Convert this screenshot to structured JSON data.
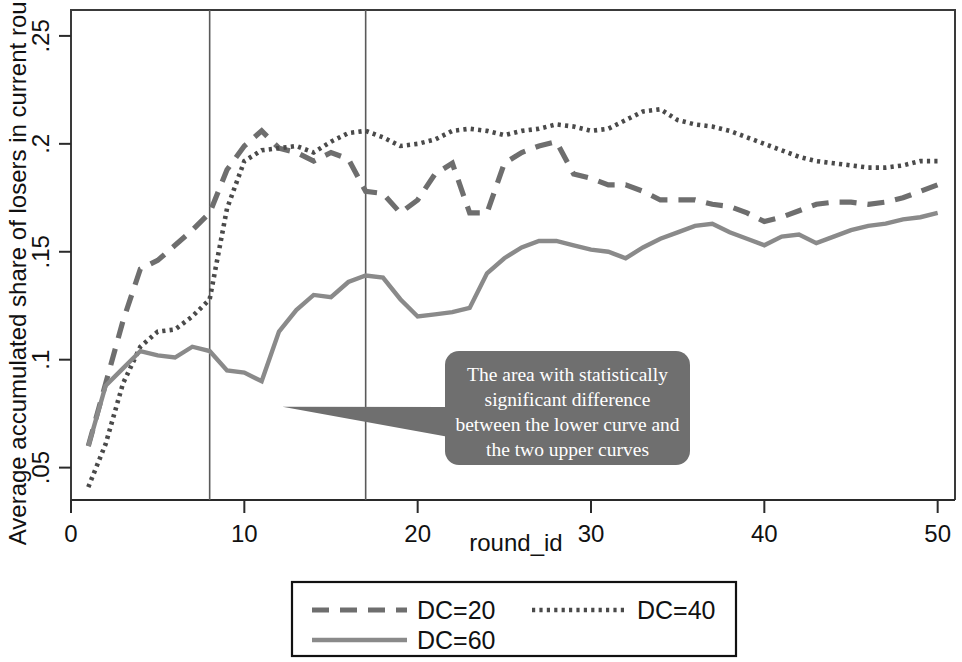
{
  "chart_data": {
    "type": "line",
    "title": "",
    "xlabel": "round_id",
    "ylabel": "Average accumulated share of losers in current round",
    "xlim": [
      0,
      51
    ],
    "ylim": [
      0.035,
      0.262
    ],
    "grid": false,
    "legend_position": "bottom",
    "x_ticks": [
      "0",
      "10",
      "20",
      "30",
      "40",
      "50"
    ],
    "x_tick_values": [
      0,
      10,
      20,
      30,
      40,
      50
    ],
    "y_ticks": [
      ".05",
      ".1",
      ".15",
      ".2",
      ".25"
    ],
    "y_tick_values": [
      0.05,
      0.1,
      0.15,
      0.2,
      0.25
    ],
    "x": [
      1,
      2,
      3,
      4,
      5,
      6,
      7,
      8,
      9,
      10,
      11,
      12,
      13,
      14,
      15,
      16,
      17,
      18,
      19,
      20,
      21,
      22,
      23,
      24,
      25,
      26,
      27,
      28,
      29,
      30,
      31,
      32,
      33,
      34,
      35,
      36,
      37,
      38,
      39,
      40,
      41,
      42,
      43,
      44,
      45,
      46,
      47,
      48,
      49,
      50
    ],
    "series": [
      {
        "name": "DC=20",
        "style": "dashed",
        "color": "#6e6e6e",
        "values": [
          0.06,
          0.089,
          0.118,
          0.142,
          0.146,
          0.153,
          0.16,
          0.168,
          0.188,
          0.199,
          0.206,
          0.198,
          0.196,
          0.192,
          0.196,
          0.193,
          0.178,
          0.177,
          0.168,
          0.174,
          0.186,
          0.191,
          0.168,
          0.168,
          0.191,
          0.196,
          0.199,
          0.201,
          0.186,
          0.184,
          0.181,
          0.181,
          0.178,
          0.174,
          0.174,
          0.174,
          0.172,
          0.171,
          0.168,
          0.164,
          0.166,
          0.169,
          0.172,
          0.173,
          0.173,
          0.172,
          0.173,
          0.175,
          0.178,
          0.181
        ]
      },
      {
        "name": "DC=40",
        "style": "dotted",
        "color": "#4a4a4a",
        "values": [
          0.041,
          0.061,
          0.089,
          0.106,
          0.113,
          0.114,
          0.12,
          0.128,
          0.17,
          0.192,
          0.197,
          0.198,
          0.199,
          0.196,
          0.201,
          0.205,
          0.206,
          0.203,
          0.199,
          0.2,
          0.202,
          0.206,
          0.207,
          0.206,
          0.204,
          0.206,
          0.207,
          0.209,
          0.208,
          0.206,
          0.207,
          0.211,
          0.215,
          0.216,
          0.211,
          0.209,
          0.208,
          0.206,
          0.203,
          0.2,
          0.197,
          0.194,
          0.192,
          0.191,
          0.19,
          0.189,
          0.189,
          0.19,
          0.192,
          0.192
        ]
      },
      {
        "name": "DC=60",
        "style": "solid",
        "color": "#8a8a8a",
        "values": [
          0.06,
          0.088,
          0.096,
          0.104,
          0.102,
          0.101,
          0.106,
          0.104,
          0.095,
          0.094,
          0.09,
          0.113,
          0.123,
          0.13,
          0.129,
          0.136,
          0.139,
          0.138,
          0.128,
          0.12,
          0.121,
          0.122,
          0.124,
          0.14,
          0.147,
          0.152,
          0.155,
          0.155,
          0.153,
          0.151,
          0.15,
          0.147,
          0.152,
          0.156,
          0.159,
          0.162,
          0.163,
          0.159,
          0.156,
          0.153,
          0.157,
          0.158,
          0.154,
          0.157,
          0.16,
          0.162,
          0.163,
          0.165,
          0.166,
          0.168
        ]
      }
    ],
    "reference_lines": [
      {
        "axis": "x",
        "value": 8
      },
      {
        "axis": "x",
        "value": 17
      }
    ],
    "annotations": [
      {
        "name": "significance-callout",
        "text": "The area with statistically significant difference between the lower curve and the two upper curves",
        "lines": [
          "The area with statistically",
          "significant difference",
          "between the lower curve and",
          "the two upper curves"
        ],
        "fill_color": "#6f6f6f",
        "text_color": "#ffffff",
        "pointer_to_x": 12.2,
        "pointer_to_y": 0.0782
      }
    ],
    "legend_entries": [
      {
        "label": "DC=20",
        "style": "dashed",
        "color": "#6e6e6e"
      },
      {
        "label": "DC=40",
        "style": "dotted",
        "color": "#4a4a4a"
      },
      {
        "label": "DC=60",
        "style": "solid",
        "color": "#8a8a8a"
      }
    ]
  }
}
